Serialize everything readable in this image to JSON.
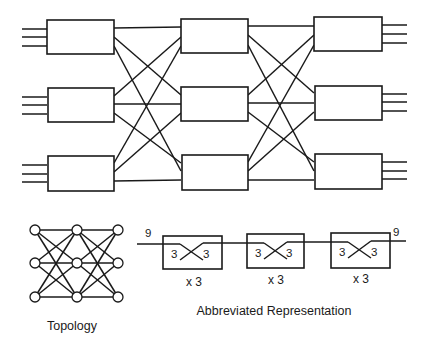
{
  "diagram": {
    "type": "three-stage switching network",
    "main_network": {
      "stages": 3,
      "switches_per_stage": 3,
      "inputs_per_switch": 3,
      "outputs_per_switch": 3,
      "interconnect": "full mesh between adjacent stages"
    },
    "topology": {
      "label": "Topology",
      "columns": 3,
      "nodes_per_column": 3
    },
    "abbreviated": {
      "label": "Abbreviated Representation",
      "input_count_label": "9",
      "output_count_label": "9",
      "stages": [
        {
          "in_label": "3",
          "out_label": "3",
          "multiplier_label": "x 3"
        },
        {
          "in_label": "3",
          "out_label": "3",
          "multiplier_label": "x 3"
        },
        {
          "in_label": "3",
          "out_label": "3",
          "multiplier_label": "x 3"
        }
      ]
    },
    "colors": {
      "line": "#1a1a1a",
      "background": "#ffffff"
    }
  }
}
